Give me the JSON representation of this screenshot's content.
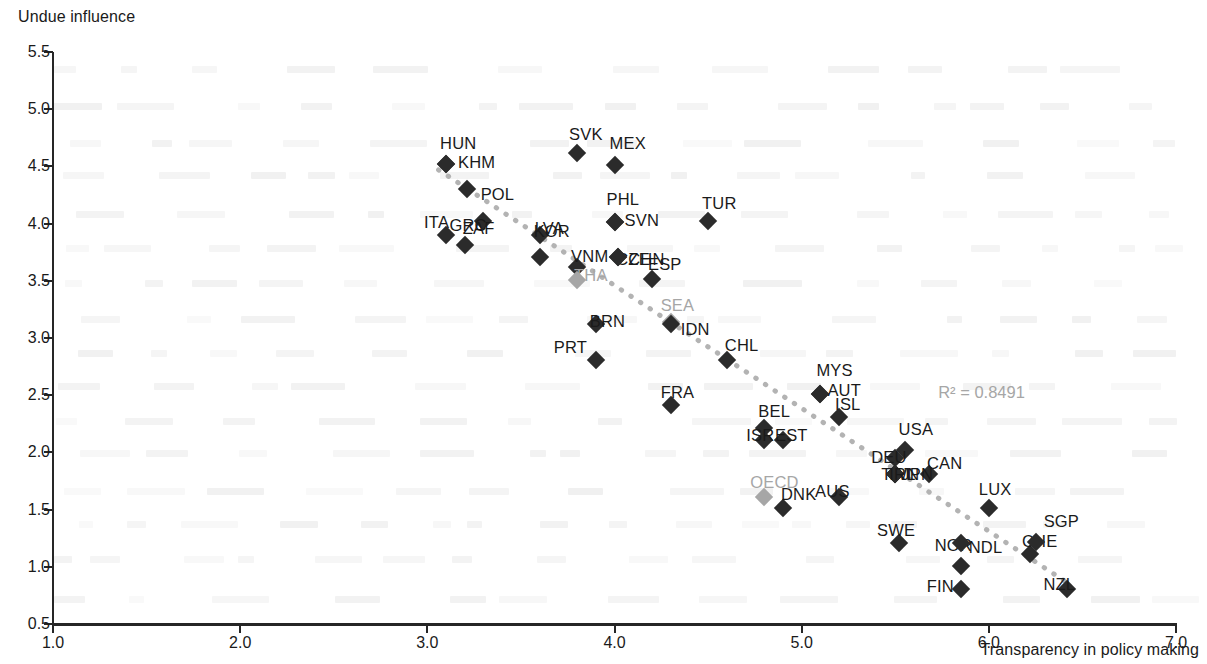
{
  "chart_data": {
    "type": "scatter",
    "title": "",
    "ylabel": "Undue influence",
    "xlabel": "Transparency in policy making",
    "xlim": [
      1.0,
      7.0
    ],
    "ylim": [
      0.5,
      5.5
    ],
    "xticks": [
      "1.0",
      "2.0",
      "3.0",
      "4.0",
      "5.0",
      "6.0",
      "7.0"
    ],
    "yticks": [
      "0.5",
      "1.0",
      "1.5",
      "2.0",
      "2.5",
      "3.0",
      "3.5",
      "4.0",
      "4.5",
      "5.0",
      "5.5"
    ],
    "grid": false,
    "legend": "none",
    "annotation": "R² = 0.8491",
    "annotation_x": 6.05,
    "annotation_y": 2.52,
    "trendline": {
      "type": "dotted",
      "color": "#b3b3b3",
      "x0": 3.06,
      "y0": 4.47,
      "x1": 6.42,
      "y1": 0.86
    },
    "colors": {
      "marker": "#2b2b2b",
      "aggregate_marker": "#a6a6a6",
      "axis": "#262626",
      "trend": "#b3b3b3",
      "annotation": "#a6a6a6"
    },
    "points": [
      {
        "label": "HUN",
        "x": 3.1,
        "y": 4.52,
        "lx": -6,
        "ly": -30,
        "group": "country"
      },
      {
        "label": "KHM",
        "x": 3.1,
        "y": 4.52,
        "lx": 12,
        "ly": -11,
        "group": "country"
      },
      {
        "label": "POL",
        "x": 3.21,
        "y": 4.3,
        "lx": 14,
        "ly": -4,
        "group": "country"
      },
      {
        "label": "ITA",
        "x": 3.1,
        "y": 3.9,
        "lx": -22,
        "ly": -22,
        "group": "country"
      },
      {
        "label": "GRC",
        "x": 3.3,
        "y": 4.02,
        "lx": -34,
        "ly": -5,
        "group": "country"
      },
      {
        "label": "ZAF",
        "x": 3.2,
        "y": 3.81,
        "lx": -2,
        "ly": -26,
        "group": "country"
      },
      {
        "label": "LVA",
        "x": 3.6,
        "y": 3.71,
        "lx": -5,
        "ly": -38,
        "group": "country"
      },
      {
        "label": "KOR",
        "x": 3.6,
        "y": 3.9,
        "lx": -6,
        "ly": -13,
        "group": "country"
      },
      {
        "label": "VNM",
        "x": 3.8,
        "y": 3.62,
        "lx": -6,
        "ly": -20,
        "group": "country"
      },
      {
        "label": "THA",
        "x": 3.8,
        "y": 3.51,
        "lx": -3,
        "ly": -14,
        "group": "aggregate"
      },
      {
        "label": "SVK",
        "x": 3.8,
        "y": 4.62,
        "lx": -8,
        "ly": -28,
        "group": "country"
      },
      {
        "label": "MEX",
        "x": 4.0,
        "y": 4.51,
        "lx": -5,
        "ly": -31,
        "group": "country"
      },
      {
        "label": "PHL",
        "x": 4.0,
        "y": 4.01,
        "lx": -8,
        "ly": -32,
        "group": "country"
      },
      {
        "label": "SVN",
        "x": 4.0,
        "y": 4.01,
        "lx": 10,
        "ly": -11,
        "group": "country"
      },
      {
        "label": "CZE",
        "x": 4.02,
        "y": 3.71,
        "lx": -2,
        "ly": -7,
        "group": "country"
      },
      {
        "label": "CHN",
        "x": 4.02,
        "y": 3.71,
        "lx": 10,
        "ly": -7,
        "group": "country"
      },
      {
        "label": "ESP",
        "x": 4.2,
        "y": 3.52,
        "lx": -4,
        "ly": -24,
        "group": "country"
      },
      {
        "label": "BRN",
        "x": 3.9,
        "y": 3.12,
        "lx": -6,
        "ly": -12,
        "group": "country"
      },
      {
        "label": "SEA",
        "x": 4.3,
        "y": 3.14,
        "lx": -10,
        "ly": -26,
        "group": "aggregate"
      },
      {
        "label": "PRT",
        "x": 3.9,
        "y": 2.81,
        "lx": -42,
        "ly": -22,
        "group": "country"
      },
      {
        "label": "IDN",
        "x": 4.3,
        "y": 3.12,
        "lx": 10,
        "ly": -4,
        "group": "country"
      },
      {
        "label": "CHL",
        "x": 4.6,
        "y": 2.81,
        "lx": -2,
        "ly": -24,
        "group": "country"
      },
      {
        "label": "TUR",
        "x": 4.5,
        "y": 4.02,
        "lx": -6,
        "ly": -27,
        "group": "country"
      },
      {
        "label": "FRA",
        "x": 4.3,
        "y": 2.41,
        "lx": -10,
        "ly": -22,
        "group": "country"
      },
      {
        "label": "MYS",
        "x": 5.1,
        "y": 2.51,
        "lx": -4,
        "ly": -33,
        "group": "country"
      },
      {
        "label": "AUT",
        "x": 5.1,
        "y": 2.51,
        "lx": 7,
        "ly": -13,
        "group": "country"
      },
      {
        "label": "BEL",
        "x": 4.8,
        "y": 2.21,
        "lx": -6,
        "ly": -26,
        "group": "country"
      },
      {
        "label": "ISR",
        "x": 4.8,
        "y": 2.11,
        "lx": -18,
        "ly": -14,
        "group": "country"
      },
      {
        "label": "EST",
        "x": 4.9,
        "y": 2.11,
        "lx": -8,
        "ly": -14,
        "group": "country"
      },
      {
        "label": "ISL",
        "x": 5.2,
        "y": 2.31,
        "lx": -4,
        "ly": -22,
        "group": "country"
      },
      {
        "label": "USA",
        "x": 5.55,
        "y": 2.02,
        "lx": -6,
        "ly": -30,
        "group": "country"
      },
      {
        "label": "CAN",
        "x": 5.68,
        "y": 1.81,
        "lx": -2,
        "ly": -20,
        "group": "country"
      },
      {
        "label": "DEU",
        "x": 5.5,
        "y": 1.95,
        "lx": -24,
        "ly": -10,
        "group": "country"
      },
      {
        "label": "JPN",
        "x": 5.5,
        "y": 1.81,
        "lx": 6,
        "ly": -9,
        "group": "country"
      },
      {
        "label": "TWN",
        "x": 5.5,
        "y": 1.81,
        "lx": -14,
        "ly": -9,
        "group": "country"
      },
      {
        "label": "IRL",
        "x": 5.5,
        "y": 1.81,
        "lx": -6,
        "ly": -9,
        "group": "country"
      },
      {
        "label": "OECD",
        "x": 4.8,
        "y": 1.61,
        "lx": -14,
        "ly": -24,
        "group": "aggregate"
      },
      {
        "label": "DNK",
        "x": 4.9,
        "y": 1.51,
        "lx": -2,
        "ly": -23,
        "group": "country"
      },
      {
        "label": "AUS",
        "x": 5.2,
        "y": 1.61,
        "lx": -24,
        "ly": -15,
        "group": "country"
      },
      {
        "label": "SWE",
        "x": 5.52,
        "y": 1.21,
        "lx": -22,
        "ly": -22,
        "group": "country"
      },
      {
        "label": "NOR",
        "x": 5.85,
        "y": 1.01,
        "lx": -26,
        "ly": -30,
        "group": "country"
      },
      {
        "label": "NDL",
        "x": 5.85,
        "y": 1.21,
        "lx": 8,
        "ly": -5,
        "group": "country"
      },
      {
        "label": "FIN",
        "x": 5.85,
        "y": 0.81,
        "lx": -34,
        "ly": -12,
        "group": "country"
      },
      {
        "label": "LUX",
        "x": 6.0,
        "y": 1.51,
        "lx": -10,
        "ly": -28,
        "group": "country"
      },
      {
        "label": "CHE",
        "x": 6.22,
        "y": 1.11,
        "lx": -8,
        "ly": -22,
        "group": "country"
      },
      {
        "label": "SGP",
        "x": 6.25,
        "y": 1.22,
        "lx": 8,
        "ly": -30,
        "group": "country"
      },
      {
        "label": "NZL",
        "x": 6.42,
        "y": 0.81,
        "lx": -24,
        "ly": -14,
        "group": "country"
      }
    ]
  }
}
